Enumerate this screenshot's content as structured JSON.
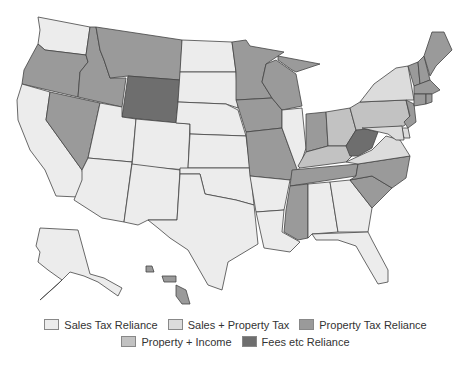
{
  "legend": {
    "rows": [
      [
        {
          "key": "sales",
          "label": "Sales Tax Reliance",
          "color": "#ececec"
        },
        {
          "key": "sales_property",
          "label": "Sales + Property Tax",
          "color": "#dcdcdc"
        },
        {
          "key": "property",
          "label": "Property Tax Reliance",
          "color": "#9a9a9a"
        }
      ],
      [
        {
          "key": "property_income",
          "label": "Property + Income",
          "color": "#c2c2c2"
        },
        {
          "key": "fees",
          "label": "Fees etc Reliance",
          "color": "#6e6e6e"
        }
      ]
    ]
  },
  "categories": {
    "sales": "#ececec",
    "sales_property": "#dcdcdc",
    "property": "#9a9a9a",
    "property_income": "#c2c2c2",
    "fees": "#6e6e6e"
  },
  "states": {
    "WA": "sales",
    "OR": "property",
    "CA": "sales",
    "NV": "property",
    "ID": "property",
    "MT": "property",
    "WY": "fees",
    "UT": "sales",
    "AZ": "sales",
    "CO": "sales",
    "NM": "sales",
    "ND": "sales",
    "SD": "sales",
    "NE": "sales",
    "KS": "sales",
    "OK": "sales",
    "TX": "sales",
    "MN": "property",
    "IA": "property",
    "MO": "property",
    "AR": "sales",
    "LA": "sales",
    "WI": "property",
    "IL": "sales",
    "MI": "property",
    "IN": "property",
    "OH": "property_income",
    "KY": "property_income",
    "TN": "property",
    "MS": "property",
    "AL": "sales",
    "GA": "sales",
    "FL": "sales",
    "SC": "property",
    "NC": "property",
    "VA": "sales_property",
    "WV": "fees",
    "PA": "property_income",
    "NY": "sales_property",
    "VT": "property",
    "NH": "property",
    "ME": "property",
    "MA": "property",
    "CT": "property",
    "RI": "property",
    "NJ": "property",
    "DE": "sales_property",
    "MD": "sales_property",
    "AK": "sales",
    "HI": "property"
  }
}
